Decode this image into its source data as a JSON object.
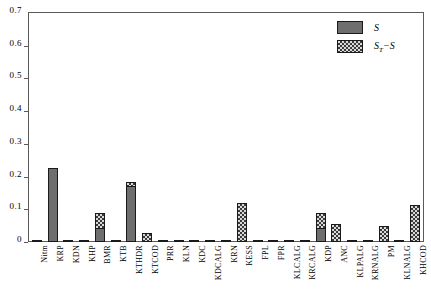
{
  "chart_data": {
    "type": "bar",
    "stacked": true,
    "title": "",
    "xlabel": "",
    "ylabel": "",
    "ylim": [
      0,
      0.7
    ],
    "ytick_labels": [
      "0",
      "0.1",
      "0.2",
      "0.3",
      "0.4",
      "0.5",
      "0.6",
      "0.7"
    ],
    "ytick_values": [
      0,
      0.1,
      0.2,
      0.3,
      0.4,
      0.5,
      0.6,
      0.7
    ],
    "grid": false,
    "legend_position": "top-right",
    "legend": [
      {
        "name": "S",
        "label": "S",
        "swatch": "solid-gray"
      },
      {
        "name": "ST-S",
        "label": "S",
        "sub": "T",
        "label_tail": "−S",
        "swatch": "checkered"
      }
    ],
    "categories": [
      "Nitm",
      "KRP",
      "KDN",
      "KHP",
      "BMR",
      "KTB",
      "KTHDR",
      "KTCOD",
      "PRR",
      "KLN",
      "KDC",
      "KDCALG",
      "KRN",
      "KESS",
      "FPL",
      "FPR",
      "KLCALG",
      "KRCALG",
      "KDP",
      "ANC",
      "KLPALG",
      "KRNALG",
      "PM",
      "KLNALG",
      "KHCOD"
    ],
    "series": [
      {
        "name": "S",
        "values": [
          0.006,
          0.227,
          0.002,
          0.002,
          0.042,
          0.004,
          0.17,
          0.0,
          0.001,
          0.002,
          0.001,
          0.001,
          0.002,
          0.0,
          0.001,
          0.001,
          0.001,
          0.002,
          0.042,
          0.0,
          0.001,
          0.002,
          0.0,
          0.001,
          0.0
        ]
      },
      {
        "name": "ST-S",
        "values": [
          0.0,
          0.0,
          0.0,
          0.0,
          0.046,
          0.0,
          0.012,
          0.028,
          0.0,
          0.0,
          0.0,
          0.0,
          0.0,
          0.118,
          0.0,
          0.0,
          0.0,
          0.0,
          0.046,
          0.055,
          0.0,
          0.0,
          0.05,
          0.0,
          0.113
        ]
      }
    ]
  }
}
